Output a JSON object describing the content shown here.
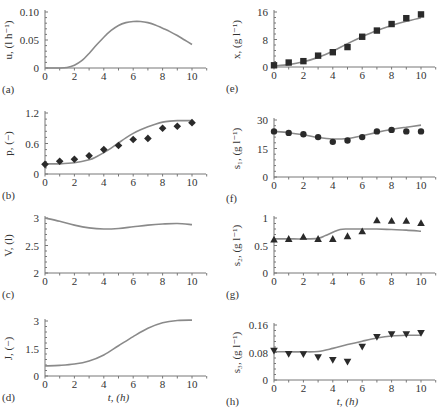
{
  "chart_data": [
    {
      "id": "a",
      "panel_label": "(a)",
      "type": "line",
      "ylabel": "u, (l h⁻¹)",
      "xlabel": "",
      "xlim": [
        0,
        11
      ],
      "ylim": [
        0,
        0.1
      ],
      "xticks": [
        0,
        2,
        4,
        6,
        8,
        10
      ],
      "yticks": [
        0,
        0.05,
        0.1
      ],
      "ytick_labels": [
        "0",
        "0.05",
        "0.10"
      ],
      "series": [
        {
          "name": "model",
          "kind": "line",
          "x": [
            0,
            1,
            1.5,
            2,
            2.5,
            3,
            3.5,
            4,
            4.5,
            5,
            5.5,
            6,
            6.5,
            7,
            7.5,
            8,
            8.5,
            9,
            9.5,
            10
          ],
          "y": [
            0,
            0,
            0.001,
            0.005,
            0.013,
            0.026,
            0.041,
            0.055,
            0.067,
            0.076,
            0.081,
            0.083,
            0.083,
            0.081,
            0.077,
            0.071,
            0.065,
            0.058,
            0.05,
            0.042
          ]
        }
      ]
    },
    {
      "id": "b",
      "panel_label": "(b)",
      "type": "line",
      "ylabel": "p, (−)",
      "xlabel": "",
      "xlim": [
        0,
        11
      ],
      "ylim": [
        0,
        1.2
      ],
      "xticks": [
        0,
        2,
        4,
        6,
        8,
        10
      ],
      "yticks": [
        0,
        0.6,
        1.2
      ],
      "ytick_labels": [
        "0",
        "0.6",
        "1.2"
      ],
      "series": [
        {
          "name": "model",
          "kind": "line",
          "x": [
            0,
            1,
            2,
            3,
            3.5,
            4,
            4.5,
            5,
            5.5,
            6,
            6.5,
            7,
            7.5,
            8,
            8.5,
            9,
            9.5,
            10
          ],
          "y": [
            0.2,
            0.2,
            0.22,
            0.28,
            0.34,
            0.42,
            0.51,
            0.61,
            0.71,
            0.8,
            0.87,
            0.93,
            0.98,
            1.02,
            1.04,
            1.05,
            1.05,
            1.05
          ]
        },
        {
          "name": "measured",
          "kind": "scatter",
          "marker": "diamond",
          "x": [
            0,
            1,
            2,
            3,
            4,
            5,
            6,
            7,
            8,
            9,
            10
          ],
          "y": [
            0.19,
            0.25,
            0.29,
            0.36,
            0.48,
            0.56,
            0.68,
            0.7,
            0.9,
            0.94,
            1.01
          ]
        }
      ]
    },
    {
      "id": "c",
      "panel_label": "(c)",
      "type": "line",
      "ylabel": "V, (l)",
      "xlabel": "",
      "xlim": [
        0,
        11
      ],
      "ylim": [
        2,
        3
      ],
      "xticks": [
        0,
        2,
        4,
        6,
        8,
        10
      ],
      "yticks": [
        2,
        2.5,
        3
      ],
      "ytick_labels": [
        "2",
        "2.5",
        "3"
      ],
      "series": [
        {
          "name": "model",
          "kind": "line",
          "x": [
            0,
            1,
            2,
            3,
            4,
            5,
            6,
            7,
            8,
            9,
            10
          ],
          "y": [
            3.0,
            2.94,
            2.87,
            2.82,
            2.8,
            2.81,
            2.84,
            2.87,
            2.89,
            2.9,
            2.88
          ]
        }
      ]
    },
    {
      "id": "d",
      "panel_label": "(d)",
      "type": "line",
      "ylabel": "J, (−)",
      "xlabel": "t, (h)",
      "xlim": [
        0,
        11
      ],
      "ylim": [
        0,
        3
      ],
      "xticks": [
        0,
        2,
        4,
        6,
        8,
        10
      ],
      "yticks": [
        0,
        1.5,
        3
      ],
      "ytick_labels": [
        "0",
        "1.5",
        "3"
      ],
      "series": [
        {
          "name": "model",
          "kind": "line",
          "x": [
            0,
            1,
            2,
            3,
            4,
            5,
            6,
            7,
            8,
            9,
            10
          ],
          "y": [
            0.55,
            0.58,
            0.65,
            0.82,
            1.15,
            1.65,
            2.15,
            2.6,
            2.9,
            3.03,
            3.05
          ]
        }
      ]
    },
    {
      "id": "e",
      "panel_label": "(e)",
      "type": "line",
      "ylabel": "x, (g l⁻¹)",
      "xlabel": "",
      "xlim": [
        0,
        11
      ],
      "ylim": [
        0,
        16
      ],
      "xticks": [
        0,
        2,
        4,
        6,
        8,
        10
      ],
      "yticks": [
        0,
        8,
        16
      ],
      "ytick_labels": [
        "0",
        "8",
        "16"
      ],
      "series": [
        {
          "name": "model",
          "kind": "line",
          "x": [
            0,
            1,
            2,
            3,
            4,
            5,
            6,
            7,
            8,
            9,
            10
          ],
          "y": [
            0.3,
            0.7,
            1.5,
            2.8,
            4.6,
            6.8,
            8.8,
            10.6,
            12.1,
            13.3,
            14.3
          ]
        },
        {
          "name": "measured",
          "kind": "scatter",
          "marker": "square",
          "x": [
            0,
            1,
            2,
            3,
            4,
            5,
            6,
            7,
            8,
            9,
            10
          ],
          "y": [
            0.5,
            1.3,
            1.7,
            3.3,
            4.3,
            5.8,
            8.8,
            10.6,
            12.5,
            14.2,
            15.3
          ]
        }
      ]
    },
    {
      "id": "f",
      "panel_label": "(f)",
      "type": "line",
      "ylabel": "s₁, (g l⁻¹)",
      "xlabel": "",
      "xlim": [
        0,
        11
      ],
      "ylim": [
        0,
        30
      ],
      "xticks": [
        0,
        2,
        4,
        6,
        8,
        10
      ],
      "yticks": [
        0,
        15,
        30
      ],
      "ytick_labels": [
        "0",
        "15",
        "30"
      ],
      "series": [
        {
          "name": "model",
          "kind": "line",
          "x": [
            0,
            1,
            2,
            3,
            4,
            5,
            6,
            7,
            8,
            9,
            10
          ],
          "y": [
            24,
            23.3,
            22.2,
            20.8,
            20,
            20.3,
            21.7,
            23.5,
            25,
            26.2,
            27.3
          ]
        },
        {
          "name": "measured",
          "kind": "scatter",
          "marker": "circle",
          "x": [
            0,
            1,
            2,
            3,
            4,
            5,
            6,
            7,
            8,
            9,
            10
          ],
          "y": [
            24,
            23.2,
            22.5,
            21,
            18.5,
            19.2,
            21,
            24,
            24.8,
            24,
            24
          ]
        }
      ]
    },
    {
      "id": "g",
      "panel_label": "(g)",
      "type": "line",
      "ylabel": "s₂, (g l⁻¹)",
      "xlabel": "",
      "xlim": [
        0,
        11
      ],
      "ylim": [
        0,
        1
      ],
      "xticks": [
        0,
        2,
        4,
        6,
        8,
        10
      ],
      "yticks": [
        0,
        0.5,
        1
      ],
      "ytick_labels": [
        "0",
        "0.5",
        "1"
      ],
      "series": [
        {
          "name": "model",
          "kind": "line",
          "x": [
            0,
            1,
            2,
            3,
            3.5,
            4,
            4.5,
            5,
            6,
            7,
            8,
            9,
            10
          ],
          "y": [
            0.62,
            0.62,
            0.62,
            0.63,
            0.68,
            0.74,
            0.79,
            0.8,
            0.8,
            0.8,
            0.79,
            0.78,
            0.76
          ]
        },
        {
          "name": "measured",
          "kind": "scatter",
          "marker": "triangle-up",
          "x": [
            0,
            1,
            2,
            3,
            4,
            5,
            6,
            7,
            8,
            9,
            10
          ],
          "y": [
            0.61,
            0.62,
            0.66,
            0.62,
            0.62,
            0.67,
            0.76,
            0.96,
            0.95,
            0.95,
            0.91
          ]
        }
      ]
    },
    {
      "id": "h",
      "panel_label": "(h)",
      "type": "line",
      "ylabel": "s₃, (g l⁻¹)",
      "xlabel": "t, (h)",
      "xlim": [
        0,
        11
      ],
      "ylim": [
        0,
        0.16
      ],
      "xticks": [
        0,
        2,
        4,
        6,
        8,
        10
      ],
      "yticks": [
        0,
        0.08,
        0.16
      ],
      "ytick_labels": [
        "0",
        "0.08",
        "0.16"
      ],
      "series": [
        {
          "name": "model",
          "kind": "line",
          "x": [
            0,
            1,
            2,
            3,
            4,
            5,
            6,
            7,
            8,
            9,
            10
          ],
          "y": [
            0.082,
            0.082,
            0.082,
            0.083,
            0.092,
            0.103,
            0.113,
            0.122,
            0.128,
            0.13,
            0.13
          ]
        },
        {
          "name": "measured",
          "kind": "scatter",
          "marker": "triangle-down",
          "x": [
            0,
            1,
            2,
            3,
            4,
            5,
            6,
            7,
            8,
            9,
            10
          ],
          "y": [
            0.085,
            0.076,
            0.075,
            0.066,
            0.058,
            0.053,
            0.097,
            0.125,
            0.133,
            0.133,
            0.137
          ]
        }
      ]
    }
  ],
  "layout": {
    "panels": {
      "a": {
        "x0": 45,
        "x10": 192,
        "xend": 206,
        "ytop": 12,
        "ybot": 68
      },
      "b": {
        "x0": 45,
        "x10": 192,
        "xend": 206,
        "ytop": 113,
        "ybot": 174
      },
      "c": {
        "x0": 45,
        "x10": 192,
        "xend": 206,
        "ytop": 218,
        "ybot": 273
      },
      "d": {
        "x0": 45,
        "x10": 192,
        "xend": 206,
        "ytop": 321,
        "ybot": 376
      },
      "e": {
        "x0": 274,
        "x10": 421,
        "xend": 435,
        "ytop": 12,
        "ybot": 67
      },
      "f": {
        "x0": 274,
        "x10": 421,
        "xend": 435,
        "ytop": 120,
        "ybot": 177
      },
      "g": {
        "x0": 274,
        "x10": 421,
        "xend": 435,
        "ytop": 218,
        "ybot": 273
      },
      "h": {
        "x0": 274,
        "x10": 421,
        "xend": 435,
        "ytop": 325,
        "ybot": 380
      }
    },
    "colors": {
      "curve": "#8a8a8a",
      "marker": "#2a2a2a",
      "axis": "#777777",
      "text": "#333333"
    }
  }
}
